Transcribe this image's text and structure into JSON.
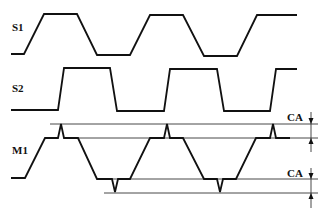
{
  "diagram": {
    "signals": [
      {
        "id": "S1",
        "label": "S1",
        "label_pos": [
          12,
          29
        ],
        "points": [
          [
            11,
            54
          ],
          [
            24,
            54
          ],
          [
            44,
            14
          ],
          [
            77,
            14
          ],
          [
            97,
            55
          ],
          [
            130,
            55
          ],
          [
            150,
            15
          ],
          [
            183,
            15
          ],
          [
            204,
            56
          ],
          [
            237,
            56
          ],
          [
            257,
            15
          ],
          [
            297,
            15
          ]
        ]
      },
      {
        "id": "S2",
        "label": "S2",
        "label_pos": [
          12,
          90
        ],
        "points": [
          [
            11,
            110
          ],
          [
            58,
            110
          ],
          [
            64,
            68
          ],
          [
            110,
            68
          ],
          [
            117,
            111
          ],
          [
            164,
            111
          ],
          [
            170,
            69
          ],
          [
            217,
            69
          ],
          [
            224,
            111
          ],
          [
            270,
            111
          ],
          [
            276,
            69
          ],
          [
            297,
            69
          ]
        ]
      },
      {
        "id": "M1",
        "label": "M1",
        "label_pos": [
          12,
          152
        ],
        "points": [
          [
            11,
            178
          ],
          [
            25,
            178
          ],
          [
            45,
            138
          ],
          [
            58,
            138
          ],
          [
            61,
            124
          ],
          [
            64,
            138
          ],
          [
            78,
            138
          ],
          [
            97,
            179
          ],
          [
            112,
            179
          ],
          [
            115,
            192
          ],
          [
            118,
            179
          ],
          [
            130,
            179
          ],
          [
            150,
            138
          ],
          [
            164,
            138
          ],
          [
            167,
            124
          ],
          [
            170,
            138
          ],
          [
            183,
            138
          ],
          [
            204,
            179
          ],
          [
            217,
            179
          ],
          [
            220,
            192
          ],
          [
            223,
            179
          ],
          [
            236,
            179
          ],
          [
            256,
            138
          ],
          [
            270,
            138
          ],
          [
            273,
            124
          ],
          [
            276,
            138
          ],
          [
            290,
            138
          ]
        ]
      }
    ],
    "reference_lines": [
      {
        "y": 124,
        "x1": 50,
        "x2": 318
      },
      {
        "y": 138,
        "x1": 64,
        "x2": 318
      },
      {
        "y": 179,
        "x1": 97,
        "x2": 318
      },
      {
        "y": 193,
        "x1": 104,
        "x2": 318
      }
    ],
    "dimensions": [
      {
        "label": "CA",
        "x": 311,
        "y_top": 124,
        "y_bottom": 138,
        "line_from": 112,
        "line_to": 152,
        "label_pos": [
          288,
          119
        ]
      },
      {
        "label": "CA",
        "x": 311,
        "y_top": 179,
        "y_bottom": 193,
        "line_from": 168,
        "line_to": 208,
        "label_pos": [
          288,
          175
        ]
      }
    ],
    "colors": {
      "stroke": "#111111",
      "ref_line": "#333333",
      "background": "#ffffff"
    }
  }
}
